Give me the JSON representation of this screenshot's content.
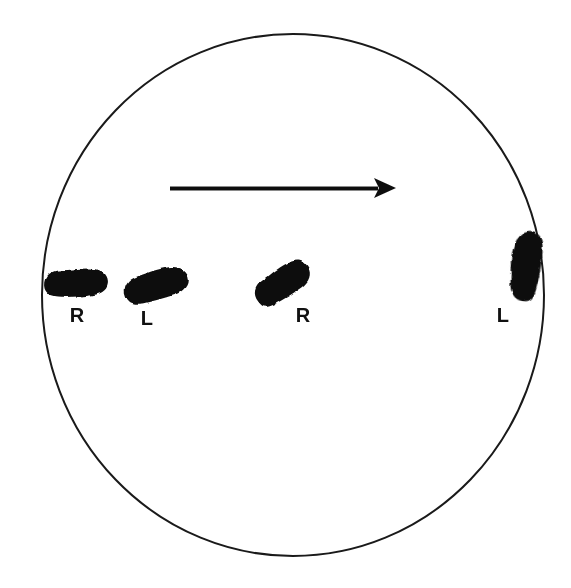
{
  "figure": {
    "background_color": "#ffffff",
    "ink_color": "#111111",
    "width": 571,
    "height": 588
  },
  "boundary": {
    "name": "circle-boundary",
    "shape": "circle",
    "center_x": 293,
    "center_y": 295,
    "radius_x": 251,
    "radius_y": 261,
    "stroke_color": "#1a1a1a",
    "stroke_width": 2
  },
  "direction_arrow": {
    "name": "direction-arrow",
    "label": "direction of travel",
    "x_start": 170,
    "x_end": 396,
    "y": 188,
    "points": "right",
    "stroke_width": 4,
    "head_length": 22,
    "head_width": 20
  },
  "walk_line": {
    "name": "walk-line",
    "y": 290,
    "x_start": 42,
    "x_end": 541,
    "dash": 11,
    "gap": 9,
    "stroke_width": 3.5
  },
  "footprints": [
    {
      "name": "footprint-1",
      "label": "R",
      "foot": "right",
      "index": 1,
      "cx": 76,
      "cy": 283,
      "length": 64,
      "width": 27,
      "rotation_deg": -3,
      "label_x": 77,
      "label_y": 322
    },
    {
      "name": "footprint-2",
      "label": "L",
      "foot": "left",
      "index": 2,
      "cx": 156,
      "cy": 285,
      "length": 64,
      "width": 29,
      "rotation_deg": -16,
      "label_x": 147,
      "label_y": 325
    },
    {
      "name": "footprint-3",
      "label": "R",
      "foot": "right",
      "index": 3,
      "cx": 282,
      "cy": 283,
      "length": 60,
      "width": 28,
      "rotation_deg": -32,
      "label_x": 303,
      "label_y": 322
    },
    {
      "name": "footprint-4",
      "label": "L",
      "foot": "left",
      "index": 4,
      "cx": 525,
      "cy": 266,
      "length": 70,
      "width": 29,
      "rotation_deg": -82,
      "label_x": 503,
      "label_y": 322
    }
  ]
}
